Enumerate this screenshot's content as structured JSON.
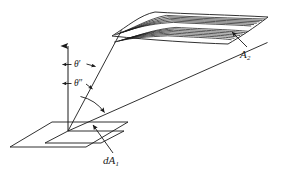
{
  "figure": {
    "kind": "line-diagram",
    "background_color": "#ffffff",
    "line_color": "#1a1a1a",
    "labels": {
      "theta_prime": "θ",
      "theta_prime_marks": "′",
      "theta_double_prime": "θ",
      "theta_double_prime_marks": "″",
      "surface_a2_symbol": "A",
      "surface_a2_subscript": "2",
      "element_da1_symbol": "dA",
      "element_da1_subscript": "1"
    },
    "icons": {
      "normal_axis": "up-arrow-icon",
      "angle_arc": "arc-arrow-icon",
      "a2_leader": "leader-arrow-icon",
      "da1_leader": "leader-arrow-icon",
      "theta_prime_left_tick": "left-arrow-icon",
      "theta_prime_right_tick": "right-arrow-icon",
      "theta_dprime_left_tick": "left-arrow-icon",
      "theta_dprime_right_tick": "right-arrow-icon"
    },
    "geometry": {
      "origin": [
        68,
        131
      ],
      "normal_axis_top": [
        68,
        40
      ],
      "base_plane_outer": [
        [
          10,
          147
        ],
        [
          52,
          122
        ],
        [
          128,
          122
        ],
        [
          86,
          147
        ]
      ],
      "base_plane_inner_da1": [
        [
          45,
          143
        ],
        [
          68,
          131
        ],
        [
          124,
          131
        ],
        [
          101,
          143
        ]
      ],
      "ray_upper_to_a2_near_corner": [
        [
          68,
          131
        ],
        [
          122,
          30
        ]
      ],
      "ray_lower_to_a2_far_corner": [
        [
          68,
          131
        ],
        [
          268,
          43
        ]
      ],
      "a2_surface_quad": [
        [
          112,
          36
        ],
        [
          155,
          12
        ],
        [
          268,
          17
        ],
        [
          228,
          44
        ]
      ],
      "a2_wave_line_count": 13,
      "angle_arc_center": [
        68,
        131
      ],
      "angle_arc_radius": 42
    }
  }
}
